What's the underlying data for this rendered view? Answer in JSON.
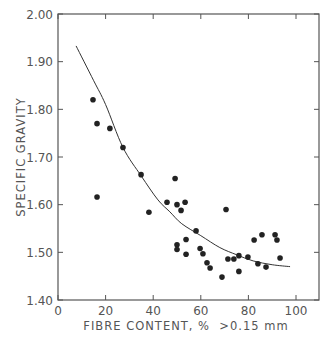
{
  "chart_data": {
    "type": "scatter",
    "title": "",
    "xlabel": "FIBRE CONTENT, %  >0.15 mm",
    "ylabel": "SPECIFIC GRAVITY",
    "xlim": [
      0,
      108
    ],
    "ylim": [
      1.4,
      2.0
    ],
    "x_ticks": [
      0,
      20,
      40,
      60,
      80,
      100
    ],
    "x_tick_labels": [
      "0",
      "20",
      "40",
      "60",
      "80",
      "100"
    ],
    "y_ticks": [
      1.4,
      1.5,
      1.6,
      1.7,
      1.8,
      1.9,
      2.0
    ],
    "y_tick_labels": [
      "1.40",
      "1.50",
      "1.60",
      "1.70",
      "1.80",
      "1.90",
      "2.00"
    ],
    "grid": false,
    "legend": null,
    "series": [
      {
        "name": "observations",
        "kind": "scatter",
        "x": [
          14.7,
          16.4,
          21.8,
          27.3,
          16.4,
          34.9,
          49.2,
          45.8,
          38.2,
          50.0,
          53.4,
          51.7,
          58.0,
          50.0,
          50.0,
          53.8,
          53.8,
          59.7,
          60.9,
          62.6,
          63.9,
          68.9,
          71.4,
          73.9,
          76.0,
          76.0,
          70.6,
          82.4,
          85.7,
          91.2,
          92.0,
          93.3,
          84.0,
          79.8,
          87.4
        ],
        "y": [
          1.82,
          1.77,
          1.76,
          1.72,
          1.616,
          1.663,
          1.655,
          1.605,
          1.584,
          1.6,
          1.605,
          1.588,
          1.545,
          1.516,
          1.506,
          1.527,
          1.496,
          1.508,
          1.497,
          1.478,
          1.467,
          1.448,
          1.486,
          1.486,
          1.493,
          1.46,
          1.59,
          1.526,
          1.537,
          1.537,
          1.526,
          1.488,
          1.476,
          1.49,
          1.469
        ]
      },
      {
        "name": "fitted curve",
        "kind": "line",
        "x": [
          7.6,
          15,
          20,
          27.3,
          35,
          42,
          47,
          52,
          60,
          68,
          75,
          82,
          90,
          97.5
        ],
        "y": [
          1.933,
          1.86,
          1.81,
          1.72,
          1.66,
          1.61,
          1.585,
          1.56,
          1.535,
          1.51,
          1.495,
          1.482,
          1.474,
          1.47
        ]
      }
    ]
  }
}
